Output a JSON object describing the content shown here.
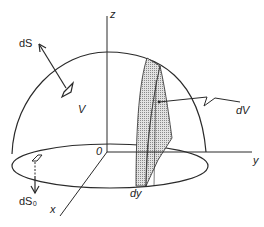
{
  "labels": {
    "z": "z",
    "y": "y",
    "x": "x",
    "origin": "0",
    "dS": "dS",
    "dS0": "dS₀",
    "V": "V",
    "dV": "dV",
    "dy": "dy"
  },
  "colors": {
    "stroke": "#2a2a2a",
    "slice_fill": "#c8c8c8",
    "background": "#ffffff"
  }
}
